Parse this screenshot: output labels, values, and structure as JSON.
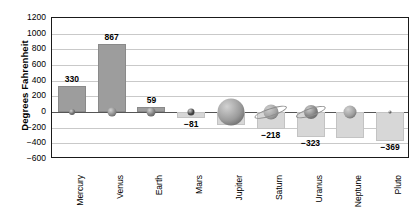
{
  "chart_data": {
    "type": "bar",
    "title": "",
    "xlabel": "",
    "ylabel": "Degrees Fahrenheit",
    "categories": [
      "Mercury",
      "Venus",
      "Earth",
      "Mars",
      "Jupiter",
      "Saturn",
      "Uranus",
      "Neptune",
      "Pluto"
    ],
    "values": [
      330,
      867,
      59,
      -81,
      -162,
      -218,
      -323,
      -330,
      -369
    ],
    "data_labels": [
      "330",
      "867",
      "59",
      "−81",
      "",
      "−218",
      "−323",
      "",
      "−369"
    ],
    "ylim": [
      -600,
      1200
    ],
    "yticks": [
      1200,
      1000,
      800,
      600,
      400,
      200,
      0,
      -200,
      -400,
      -600
    ],
    "ytick_labels": [
      "1200",
      "1000",
      "800",
      "600",
      "400",
      "200",
      "0",
      "−200",
      "−400",
      "−600"
    ],
    "grid": true,
    "legend": "none",
    "bar_color_positive": "#9d9d9d",
    "bar_color_negative": "#d7d7d7",
    "axis_color": "#1a1a1a",
    "grid_color": "#c9c9c9"
  },
  "planets": [
    {
      "name": "Mercury",
      "size": 6,
      "color": "#6e6e6e",
      "ring": false
    },
    {
      "name": "Venus",
      "size": 9,
      "color": "#8b8b8b",
      "ring": false
    },
    {
      "name": "Earth",
      "size": 9,
      "color": "#7d7d7d",
      "ring": false
    },
    {
      "name": "Mars",
      "size": 7,
      "color": "#3d3d3d",
      "ring": false
    },
    {
      "name": "Jupiter",
      "size": 27,
      "color": "#9a9a9a",
      "ring": false
    },
    {
      "name": "Saturn",
      "size": 15,
      "color": "#a2a2a2",
      "ring": true
    },
    {
      "name": "Uranus",
      "size": 14,
      "color": "#808080",
      "ring": true
    },
    {
      "name": "Neptune",
      "size": 13,
      "color": "#9e9e9e",
      "ring": false
    },
    {
      "name": "Pluto",
      "size": 3,
      "color": "#5a5a5a",
      "ring": false
    }
  ]
}
